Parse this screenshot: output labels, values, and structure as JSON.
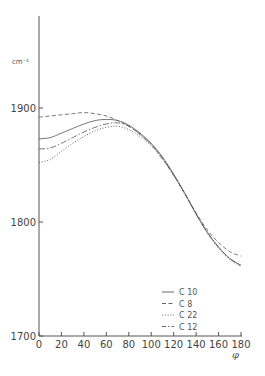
{
  "chart_data": {
    "type": "line",
    "title": "",
    "xlabel": "φ",
    "ylabel": "cm⁻¹",
    "xlim": [
      0,
      180
    ],
    "ylim": [
      1700,
      1960
    ],
    "x_ticks": [
      0,
      20,
      40,
      60,
      80,
      100,
      120,
      140,
      160,
      180
    ],
    "x_tick_labels": [
      "0",
      "20",
      "40",
      "60",
      "80",
      "100",
      "120",
      "140",
      "160",
      "180"
    ],
    "y_ticks": [
      1700,
      1800,
      1900
    ],
    "y_tick_labels": [
      "1700",
      "1800",
      "1900"
    ],
    "grid": false,
    "legend_position": "lower right",
    "x": [
      0,
      10,
      20,
      30,
      40,
      50,
      60,
      70,
      80,
      90,
      100,
      110,
      120,
      130,
      140,
      150,
      160,
      170,
      180
    ],
    "series": [
      {
        "name": "C 10",
        "style": "solid",
        "values": [
          1873,
          1874,
          1878,
          1882,
          1886,
          1889,
          1890,
          1889,
          1885,
          1878,
          1869,
          1857,
          1842,
          1825,
          1807,
          1791,
          1778,
          1768,
          1762
        ]
      },
      {
        "name": "C 8",
        "style": "dashed",
        "values": [
          1892,
          1893,
          1894,
          1895,
          1896,
          1895,
          1893,
          1889,
          1884,
          1877,
          1868,
          1856,
          1841,
          1825,
          1808,
          1793,
          1782,
          1774,
          1770
        ]
      },
      {
        "name": "C 22",
        "style": "dotted",
        "values": [
          1852,
          1855,
          1862,
          1869,
          1875,
          1880,
          1883,
          1884,
          1881,
          1875,
          1867,
          1855,
          1841,
          1824,
          1807,
          1790,
          1777,
          1767,
          1761
        ]
      },
      {
        "name": "C 12",
        "style": "dashdot",
        "values": [
          1864,
          1865,
          1869,
          1874,
          1879,
          1883,
          1886,
          1887,
          1884,
          1877,
          1868,
          1856,
          1841,
          1825,
          1807,
          1791,
          1778,
          1768,
          1762
        ]
      }
    ]
  },
  "legend": [
    {
      "label": "C 10",
      "style": "solid"
    },
    {
      "label": "C 8",
      "style": "dashed"
    },
    {
      "label": "C 22",
      "style": "dotted"
    },
    {
      "label": "C 12",
      "style": "dashdot"
    }
  ],
  "axes": {
    "y_unit": "cm⁻¹",
    "x_title": "φ"
  },
  "colors": {
    "axis": "#555555",
    "line": "#555555",
    "background": "#ffffff"
  }
}
